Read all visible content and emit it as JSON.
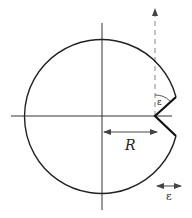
{
  "diagram": {
    "colors": {
      "stroke": "#222222",
      "axis": "#333333",
      "dashed": "#777777",
      "background": "#ffffff"
    },
    "labels": {
      "radius": "R",
      "angle": "ε",
      "width": "ε"
    },
    "geometry": {
      "center": [
        102,
        116
      ],
      "radius": 77,
      "notch_vertex": [
        155,
        116
      ],
      "notch_upper_end": [
        176,
        97
      ],
      "notch_lower_end": [
        176,
        136
      ],
      "horizontal_axis": {
        "x1": 11,
        "x2": 172,
        "y": 116
      },
      "vertical_axis": {
        "x": 102,
        "y1": 23,
        "y2": 210
      },
      "dashed_line": {
        "x": 155,
        "y1": 8,
        "y2": 116
      },
      "radius_arrow": {
        "x1": 103,
        "x2": 158,
        "y": 132
      },
      "width_arrow": {
        "x1": 157,
        "x2": 181,
        "y": 186
      }
    }
  }
}
